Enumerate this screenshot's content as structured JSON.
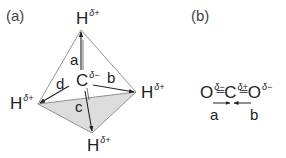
{
  "panels": {
    "a": {
      "label": "(a)",
      "center": {
        "symbol": "C",
        "charge": "δ−"
      },
      "vertices": [
        {
          "id": "top",
          "symbol": "H",
          "charge": "δ+"
        },
        {
          "id": "right",
          "symbol": "H",
          "charge": "δ+"
        },
        {
          "id": "left",
          "symbol": "H",
          "charge": "δ+"
        },
        {
          "id": "bottom",
          "symbol": "H",
          "charge": "δ+"
        }
      ],
      "bond_labels": [
        "a",
        "b",
        "c",
        "d"
      ]
    },
    "b": {
      "label": "(b)",
      "atoms": [
        {
          "symbol": "O",
          "charge": "δ−"
        },
        {
          "symbol": "C",
          "charge": "δ+"
        },
        {
          "symbol": "O",
          "charge": "δ−"
        }
      ],
      "double_bond": "═",
      "bond_labels": [
        "a",
        "b"
      ]
    }
  },
  "colors": {
    "line": "#333333",
    "face_shade": "#dcdcdc",
    "edge": "#888888"
  }
}
